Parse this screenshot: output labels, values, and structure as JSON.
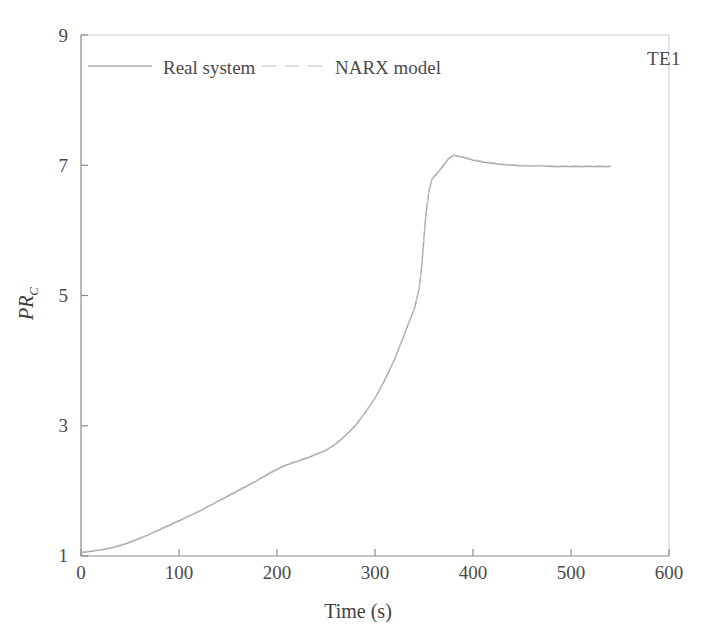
{
  "chart_data": {
    "type": "line",
    "title": "",
    "subtitle": "",
    "xlabel": "Time (s)",
    "ylabel": "PR_C",
    "ylabel_base": "PR",
    "ylabel_sub": "C",
    "xlim": [
      0,
      600
    ],
    "ylim": [
      1,
      9
    ],
    "xticks": [
      "0",
      "100",
      "200",
      "300",
      "400",
      "500",
      "600"
    ],
    "xtick_values": [
      0,
      100,
      200,
      300,
      400,
      500,
      600
    ],
    "yticks": [
      "1",
      "3",
      "5",
      "7",
      "9"
    ],
    "ytick_values": [
      1,
      3,
      5,
      7,
      9
    ],
    "grid": false,
    "legend_position": "top-left-inside",
    "annotations": [
      {
        "name": "panel-id",
        "text": "TE1",
        "position": "top-right-inside"
      }
    ],
    "line_color": "#8e8e8e",
    "axis_color": "#8a8a8a",
    "series": [
      {
        "name": "Real system",
        "style": "solid",
        "x": [
          0,
          10,
          20,
          30,
          40,
          50,
          60,
          70,
          80,
          90,
          100,
          110,
          120,
          130,
          140,
          150,
          160,
          170,
          180,
          190,
          200,
          210,
          220,
          230,
          240,
          250,
          260,
          270,
          280,
          290,
          300,
          310,
          320,
          330,
          335,
          340,
          345,
          348,
          350,
          352,
          355,
          358,
          360,
          365,
          370,
          375,
          380,
          390,
          400,
          410,
          420,
          430,
          440,
          450,
          460,
          470,
          480,
          490,
          500,
          510,
          520,
          530,
          540
        ],
        "values": [
          1.05,
          1.07,
          1.09,
          1.12,
          1.16,
          1.21,
          1.27,
          1.33,
          1.4,
          1.47,
          1.54,
          1.61,
          1.68,
          1.76,
          1.84,
          1.92,
          2.0,
          2.08,
          2.16,
          2.25,
          2.33,
          2.4,
          2.45,
          2.5,
          2.56,
          2.62,
          2.72,
          2.85,
          3.0,
          3.2,
          3.42,
          3.7,
          4.02,
          4.4,
          4.6,
          4.78,
          5.1,
          5.5,
          5.9,
          6.25,
          6.6,
          6.78,
          6.82,
          6.9,
          7.0,
          7.1,
          7.15,
          7.12,
          7.08,
          7.05,
          7.03,
          7.01,
          7.0,
          6.99,
          6.99,
          6.99,
          6.98,
          6.98,
          6.98,
          6.98,
          6.98,
          6.98,
          6.98
        ]
      },
      {
        "name": "NARX model",
        "style": "dashed",
        "x": [
          0,
          10,
          20,
          30,
          40,
          50,
          60,
          70,
          80,
          90,
          100,
          110,
          120,
          130,
          140,
          150,
          160,
          170,
          180,
          190,
          200,
          210,
          220,
          230,
          240,
          250,
          260,
          270,
          280,
          290,
          300,
          310,
          320,
          330,
          335,
          340,
          345,
          348,
          350,
          352,
          355,
          358,
          360,
          365,
          370,
          375,
          380,
          390,
          400,
          410,
          420,
          430,
          440,
          450,
          460,
          470,
          480,
          490,
          500,
          510,
          520,
          530,
          540
        ],
        "values": [
          1.06,
          1.08,
          1.1,
          1.13,
          1.17,
          1.22,
          1.28,
          1.34,
          1.41,
          1.48,
          1.55,
          1.62,
          1.69,
          1.77,
          1.85,
          1.93,
          2.01,
          2.09,
          2.17,
          2.26,
          2.34,
          2.41,
          2.46,
          2.51,
          2.57,
          2.63,
          2.73,
          2.86,
          3.01,
          3.21,
          3.43,
          3.71,
          4.03,
          4.41,
          4.61,
          4.79,
          5.11,
          5.51,
          5.91,
          6.26,
          6.61,
          6.79,
          6.83,
          6.91,
          7.01,
          7.11,
          7.16,
          7.13,
          7.09,
          7.06,
          7.04,
          7.02,
          7.01,
          7.0,
          7.0,
          7.0,
          6.99,
          6.99,
          6.99,
          6.99,
          6.99,
          6.99,
          6.99
        ]
      }
    ]
  },
  "legend": {
    "items": [
      {
        "label": "Real system",
        "style": "solid"
      },
      {
        "label": "NARX model",
        "style": "dashed"
      }
    ]
  }
}
